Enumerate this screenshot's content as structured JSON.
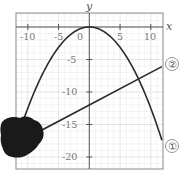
{
  "chart_data": {
    "type": "line",
    "title": "",
    "xlabel": "x",
    "ylabel": "y",
    "xlim": [
      -12,
      12
    ],
    "ylim": [
      -22,
      2
    ],
    "grid": true,
    "minor_grid_step": 1,
    "x_ticks": [
      -10,
      -5,
      0,
      5,
      10
    ],
    "x_tick_labels": [
      "-10",
      "-5",
      "0",
      "5",
      "10"
    ],
    "y_ticks": [
      -5,
      -10,
      -15,
      -20
    ],
    "y_tick_labels": [
      "-5",
      "-10",
      "-15",
      "-20"
    ],
    "series": [
      {
        "name": "①",
        "label": "①",
        "kind": "parabola",
        "equation": "y = -x^2/8",
        "x": [
          -12,
          -10,
          -8,
          -6,
          -4,
          -2,
          0,
          2,
          4,
          6,
          8,
          10,
          11.8
        ],
        "values": [
          -18,
          -12.5,
          -8,
          -4.5,
          -2,
          -0.5,
          0,
          -0.5,
          -2,
          -4.5,
          -8,
          -12.5,
          -17.4
        ]
      },
      {
        "name": "②",
        "label": "②",
        "kind": "line",
        "equation": "y = x/2 - 12",
        "x": [
          -12,
          0,
          11.8
        ],
        "values": [
          -18,
          -12,
          -6.1
        ]
      }
    ],
    "annotations": [
      "①",
      "②"
    ],
    "legend": "none (inline circled labels at right end of each curve)",
    "occlusion": "dark ink blot covering lower-left region near x≈-12..-7, y≈-14..-21"
  },
  "labels": {
    "x_axis": "x",
    "y_axis": "y",
    "curve1": "①",
    "curve2": "②",
    "ticks": {
      "xm10": "-10",
      "xm5": "-5",
      "x0": "0",
      "x5": "5",
      "x10": "10",
      "ym5": "-5",
      "ym10": "-10",
      "ym15": "-15",
      "ym20": "-20"
    }
  },
  "colors": {
    "curve": "#2b2b2b",
    "axis": "#555555",
    "grid": "#e2e2e2",
    "frame": "#8a8a8a",
    "blot": "#1a1a1a"
  }
}
